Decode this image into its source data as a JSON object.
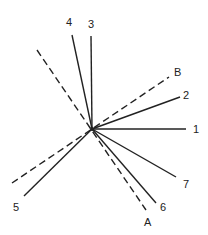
{
  "diagram": {
    "center": {
      "x": 92,
      "y": 129
    },
    "solid_lines": [
      {
        "label": "1",
        "end": {
          "x": 186,
          "y": 129
        },
        "label_pos": {
          "x": 193,
          "y": 133
        }
      },
      {
        "label": "2",
        "end": {
          "x": 180,
          "y": 97
        },
        "label_pos": {
          "x": 183,
          "y": 99
        }
      },
      {
        "label": "3",
        "end": {
          "x": 91,
          "y": 36
        },
        "label_pos": {
          "x": 88,
          "y": 28
        }
      },
      {
        "label": "4",
        "end": {
          "x": 72,
          "y": 35
        },
        "label_pos": {
          "x": 66,
          "y": 26
        }
      },
      {
        "label": "5",
        "end": {
          "x": 24,
          "y": 196
        },
        "label_pos": {
          "x": 13,
          "y": 211
        }
      },
      {
        "label": "6",
        "end": {
          "x": 156,
          "y": 203
        },
        "label_pos": {
          "x": 160,
          "y": 211
        }
      },
      {
        "label": "7",
        "end": {
          "x": 176,
          "y": 177
        },
        "label_pos": {
          "x": 183,
          "y": 188
        }
      }
    ],
    "dashed_lines": [
      {
        "label": "A",
        "start": {
          "x": 37,
          "y": 50
        },
        "end": {
          "x": 146,
          "y": 210
        },
        "label_pos": {
          "x": 144,
          "y": 226
        }
      },
      {
        "label": "B",
        "start": {
          "x": 12,
          "y": 183
        },
        "end": {
          "x": 169,
          "y": 77
        },
        "label_pos": {
          "x": 174,
          "y": 76
        }
      }
    ],
    "line_color": "#222222"
  }
}
